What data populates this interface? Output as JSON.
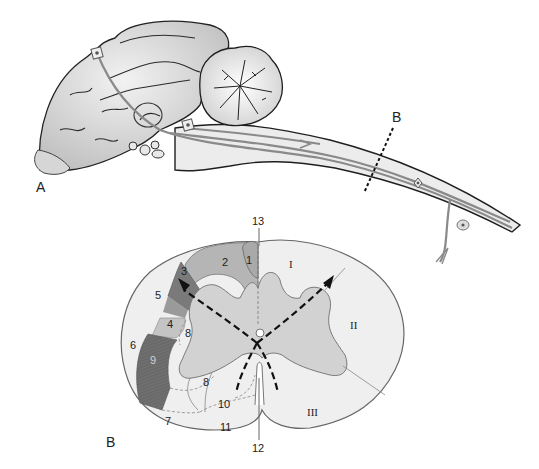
{
  "figure": {
    "panels": [
      {
        "id": "A",
        "label": "A",
        "description": "Sagittal view of brain with cerebrum, cerebellum, brainstem and spinal cord showing descending/ascending tracts and neurons",
        "section_marker": {
          "label": "B",
          "style": "dashed-line"
        }
      },
      {
        "id": "B",
        "label": "B",
        "description": "Transverse section of spinal cord showing tract regions"
      }
    ],
    "cross_section": {
      "numbered_regions": [
        {
          "n": "1"
        },
        {
          "n": "2"
        },
        {
          "n": "3"
        },
        {
          "n": "4"
        },
        {
          "n": "5"
        },
        {
          "n": "6"
        },
        {
          "n": "7"
        },
        {
          "n": "8"
        },
        {
          "n": "8"
        },
        {
          "n": "9"
        },
        {
          "n": "10"
        },
        {
          "n": "11"
        },
        {
          "n": "12"
        },
        {
          "n": "13"
        }
      ],
      "funiculi": [
        {
          "n": "I"
        },
        {
          "n": "II"
        },
        {
          "n": "III"
        }
      ]
    },
    "colors": {
      "outline": "#3a3a3a",
      "white_matter": "#efefef",
      "gray_matter": "#cfcfcf",
      "region_2": "#b3b3b3",
      "region_3": "#7a7a7a",
      "region_3b": "#9a9a9a",
      "region_4": "#c4c4c4",
      "region_9": "#6f6f6f",
      "tract_line": "#8a8a8a",
      "brain_fill": "#d9d9d9"
    }
  }
}
